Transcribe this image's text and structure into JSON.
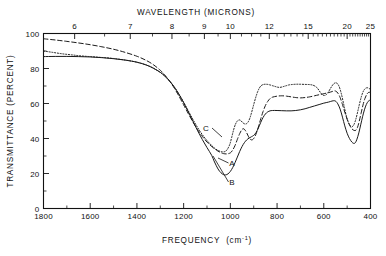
{
  "chart_data": {
    "type": "line",
    "title": "",
    "xlabel": "FREQUENCY (cm⁻¹)",
    "xlabel_main": "FREQUENCY",
    "xlabel_unit_open": "(cm",
    "xlabel_unit_sup": "-1",
    "xlabel_unit_close": ")",
    "ylabel": "TRANSMITTANCE (PERCENT)",
    "top_axis_label": "WAVELENGTH (MICRONS)",
    "xlim": [
      1800,
      400
    ],
    "ylim": [
      0,
      100
    ],
    "x_ticks": [
      1800,
      1600,
      1400,
      1200,
      1000,
      800,
      600,
      400
    ],
    "x_tick_labels": [
      "1800",
      "1600",
      "1400",
      "1200",
      "1000",
      "800",
      "600",
      "400"
    ],
    "y_ticks": [
      0,
      20,
      40,
      60,
      80,
      100
    ],
    "y_tick_labels": [
      "0",
      "20",
      "40",
      "60",
      "80",
      "100"
    ],
    "y_minor_ticks": [
      10,
      30,
      50,
      70,
      90
    ],
    "top_ticks_microns": [
      6,
      7,
      8,
      9,
      10,
      12,
      15,
      20,
      25
    ],
    "top_tick_labels": [
      "6",
      "7",
      "8",
      "9",
      "10",
      "12",
      "15",
      "20",
      "25"
    ],
    "top_minor_ticks_microns": [
      5.5,
      6.5,
      7.5,
      8.5,
      9.5,
      10.5,
      11,
      11.5,
      12.5,
      13,
      13.5,
      14,
      14.5,
      15.5,
      16,
      16.5,
      17,
      17.5,
      18,
      18.5,
      19,
      19.5,
      20.5,
      21,
      21.5,
      22,
      22.5,
      23,
      23.5,
      24,
      24.5
    ],
    "grid": false,
    "legend_position": "inline-annotations",
    "series": [
      {
        "name": "A",
        "label": "A",
        "style": "dashed",
        "color": "#1a1a1a",
        "points": [
          [
            1800,
            97.0
          ],
          [
            1750,
            96.3
          ],
          [
            1700,
            95.5
          ],
          [
            1650,
            94.6
          ],
          [
            1600,
            93.6
          ],
          [
            1550,
            92.4
          ],
          [
            1500,
            91.0
          ],
          [
            1450,
            89.2
          ],
          [
            1400,
            87.0
          ],
          [
            1360,
            84.6
          ],
          [
            1330,
            82.2
          ],
          [
            1300,
            79.0
          ],
          [
            1280,
            76.2
          ],
          [
            1260,
            72.8
          ],
          [
            1240,
            68.8
          ],
          [
            1220,
            64.2
          ],
          [
            1200,
            59.2
          ],
          [
            1180,
            54.2
          ],
          [
            1160,
            49.4
          ],
          [
            1140,
            45.0
          ],
          [
            1120,
            41.2
          ],
          [
            1100,
            38.0
          ],
          [
            1080,
            35.4
          ],
          [
            1060,
            33.4
          ],
          [
            1045,
            32.2
          ],
          [
            1030,
            31.4
          ],
          [
            1015,
            31.2
          ],
          [
            1000,
            31.8
          ],
          [
            990,
            33.4
          ],
          [
            980,
            36.0
          ],
          [
            970,
            39.5
          ],
          [
            960,
            42.8
          ],
          [
            952,
            44.8
          ],
          [
            945,
            45.6
          ],
          [
            938,
            45.0
          ],
          [
            930,
            43.2
          ],
          [
            922,
            41.0
          ],
          [
            915,
            39.6
          ],
          [
            908,
            39.2
          ],
          [
            900,
            40.0
          ],
          [
            890,
            42.6
          ],
          [
            880,
            46.6
          ],
          [
            870,
            51.2
          ],
          [
            860,
            55.4
          ],
          [
            850,
            58.8
          ],
          [
            840,
            61.2
          ],
          [
            830,
            62.8
          ],
          [
            820,
            63.6
          ],
          [
            800,
            64.2
          ],
          [
            780,
            64.4
          ],
          [
            760,
            64.2
          ],
          [
            740,
            63.8
          ],
          [
            720,
            63.4
          ],
          [
            700,
            63.2
          ],
          [
            680,
            63.4
          ],
          [
            660,
            63.8
          ],
          [
            640,
            64.4
          ],
          [
            620,
            65.0
          ],
          [
            600,
            65.6
          ],
          [
            580,
            66.2
          ],
          [
            565,
            66.8
          ],
          [
            555,
            67.2
          ],
          [
            548,
            67.0
          ],
          [
            540,
            66.0
          ],
          [
            530,
            63.4
          ],
          [
            520,
            59.4
          ],
          [
            510,
            55.0
          ],
          [
            500,
            51.0
          ],
          [
            490,
            47.8
          ],
          [
            480,
            45.6
          ],
          [
            470,
            44.6
          ],
          [
            462,
            44.8
          ],
          [
            455,
            46.6
          ],
          [
            448,
            50.0
          ],
          [
            440,
            54.6
          ],
          [
            432,
            59.2
          ],
          [
            424,
            62.8
          ],
          [
            416,
            65.2
          ],
          [
            410,
            66.2
          ],
          [
            404,
            66.4
          ],
          [
            400,
            66.2
          ]
        ]
      },
      {
        "name": "B",
        "label": "B",
        "style": "solid",
        "color": "#1a1a1a",
        "points": [
          [
            1800,
            86.8
          ],
          [
            1750,
            86.9
          ],
          [
            1700,
            86.9
          ],
          [
            1650,
            86.8
          ],
          [
            1600,
            86.6
          ],
          [
            1550,
            86.2
          ],
          [
            1500,
            85.6
          ],
          [
            1450,
            84.8
          ],
          [
            1400,
            83.6
          ],
          [
            1360,
            82.0
          ],
          [
            1330,
            80.2
          ],
          [
            1300,
            77.8
          ],
          [
            1280,
            75.6
          ],
          [
            1260,
            72.8
          ],
          [
            1240,
            69.4
          ],
          [
            1220,
            65.2
          ],
          [
            1200,
            60.4
          ],
          [
            1180,
            55.2
          ],
          [
            1160,
            49.8
          ],
          [
            1140,
            44.4
          ],
          [
            1120,
            39.4
          ],
          [
            1100,
            34.8
          ],
          [
            1080,
            30.4
          ],
          [
            1070,
            27.2
          ],
          [
            1060,
            24.4
          ],
          [
            1050,
            22.0
          ],
          [
            1040,
            20.4
          ],
          [
            1030,
            19.4
          ],
          [
            1020,
            19.2
          ],
          [
            1010,
            19.8
          ],
          [
            1000,
            21.2
          ],
          [
            990,
            23.4
          ],
          [
            980,
            26.2
          ],
          [
            970,
            29.4
          ],
          [
            960,
            32.6
          ],
          [
            950,
            35.4
          ],
          [
            940,
            37.6
          ],
          [
            930,
            39.2
          ],
          [
            920,
            40.2
          ],
          [
            910,
            41.0
          ],
          [
            900,
            41.8
          ],
          [
            890,
            43.4
          ],
          [
            880,
            46.0
          ],
          [
            870,
            49.2
          ],
          [
            860,
            52.0
          ],
          [
            850,
            54.0
          ],
          [
            840,
            55.2
          ],
          [
            830,
            55.8
          ],
          [
            820,
            56.0
          ],
          [
            800,
            56.0
          ],
          [
            780,
            55.9
          ],
          [
            760,
            55.8
          ],
          [
            740,
            55.8
          ],
          [
            720,
            56.0
          ],
          [
            700,
            56.4
          ],
          [
            680,
            57.0
          ],
          [
            660,
            57.8
          ],
          [
            640,
            58.6
          ],
          [
            620,
            59.4
          ],
          [
            600,
            60.2
          ],
          [
            580,
            60.8
          ],
          [
            565,
            61.4
          ],
          [
            555,
            61.6
          ],
          [
            548,
            61.2
          ],
          [
            540,
            59.8
          ],
          [
            530,
            56.8
          ],
          [
            520,
            52.2
          ],
          [
            510,
            47.2
          ],
          [
            500,
            43.0
          ],
          [
            490,
            40.0
          ],
          [
            480,
            38.0
          ],
          [
            472,
            37.2
          ],
          [
            465,
            37.6
          ],
          [
            458,
            39.6
          ],
          [
            450,
            43.2
          ],
          [
            442,
            47.8
          ],
          [
            434,
            52.4
          ],
          [
            426,
            56.4
          ],
          [
            418,
            59.4
          ],
          [
            410,
            61.2
          ],
          [
            404,
            61.8
          ],
          [
            400,
            61.6
          ]
        ]
      },
      {
        "name": "C",
        "label": "C",
        "style": "dotted",
        "color": "#1a1a1a",
        "points": [
          [
            1800,
            90.0
          ],
          [
            1760,
            89.2
          ],
          [
            1720,
            88.4
          ],
          [
            1680,
            87.8
          ],
          [
            1640,
            87.2
          ],
          [
            1600,
            86.8
          ],
          [
            1560,
            86.4
          ],
          [
            1520,
            86.0
          ],
          [
            1480,
            85.4
          ],
          [
            1440,
            84.6
          ],
          [
            1400,
            83.6
          ],
          [
            1360,
            82.0
          ],
          [
            1330,
            80.2
          ],
          [
            1300,
            77.8
          ],
          [
            1280,
            75.6
          ],
          [
            1260,
            72.8
          ],
          [
            1240,
            69.4
          ],
          [
            1220,
            65.4
          ],
          [
            1200,
            60.8
          ],
          [
            1180,
            55.8
          ],
          [
            1160,
            50.8
          ],
          [
            1140,
            46.2
          ],
          [
            1120,
            42.2
          ],
          [
            1100,
            38.8
          ],
          [
            1080,
            36.0
          ],
          [
            1065,
            34.2
          ],
          [
            1050,
            33.0
          ],
          [
            1035,
            32.4
          ],
          [
            1022,
            32.6
          ],
          [
            1012,
            34.0
          ],
          [
            1002,
            36.8
          ],
          [
            994,
            40.8
          ],
          [
            986,
            45.0
          ],
          [
            978,
            48.2
          ],
          [
            970,
            50.0
          ],
          [
            962,
            50.6
          ],
          [
            955,
            50.2
          ],
          [
            948,
            49.2
          ],
          [
            940,
            48.4
          ],
          [
            932,
            48.4
          ],
          [
            924,
            49.4
          ],
          [
            916,
            51.8
          ],
          [
            908,
            55.4
          ],
          [
            900,
            59.4
          ],
          [
            892,
            63.2
          ],
          [
            884,
            66.4
          ],
          [
            876,
            68.8
          ],
          [
            868,
            70.2
          ],
          [
            860,
            70.8
          ],
          [
            850,
            71.0
          ],
          [
            840,
            70.9
          ],
          [
            830,
            70.6
          ],
          [
            820,
            70.2
          ],
          [
            810,
            69.8
          ],
          [
            800,
            69.4
          ],
          [
            790,
            69.2
          ],
          [
            780,
            69.4
          ],
          [
            770,
            69.8
          ],
          [
            760,
            70.2
          ],
          [
            750,
            70.6
          ],
          [
            740,
            70.8
          ],
          [
            720,
            71.0
          ],
          [
            700,
            71.0
          ],
          [
            680,
            70.9
          ],
          [
            660,
            70.8
          ],
          [
            645,
            70.4
          ],
          [
            632,
            69.4
          ],
          [
            622,
            67.8
          ],
          [
            614,
            66.2
          ],
          [
            606,
            65.0
          ],
          [
            598,
            64.6
          ],
          [
            590,
            65.0
          ],
          [
            582,
            66.2
          ],
          [
            574,
            68.0
          ],
          [
            566,
            69.8
          ],
          [
            558,
            71.2
          ],
          [
            550,
            71.8
          ],
          [
            542,
            71.4
          ],
          [
            534,
            69.6
          ],
          [
            526,
            66.2
          ],
          [
            518,
            61.6
          ],
          [
            510,
            56.6
          ],
          [
            502,
            52.2
          ],
          [
            494,
            49.0
          ],
          [
            486,
            47.2
          ],
          [
            478,
            46.8
          ],
          [
            470,
            48.2
          ],
          [
            462,
            51.4
          ],
          [
            454,
            55.8
          ],
          [
            446,
            60.4
          ],
          [
            438,
            64.4
          ],
          [
            430,
            67.2
          ],
          [
            422,
            68.6
          ],
          [
            414,
            69.0
          ],
          [
            406,
            68.6
          ],
          [
            400,
            68.0
          ]
        ]
      }
    ],
    "annotations": [
      {
        "text": "A",
        "series": "A",
        "x_data": 930,
        "y_data": 33.0
      },
      {
        "text": "B",
        "series": "B",
        "x_data": 925,
        "y_data": 22.0
      },
      {
        "text": "C",
        "series": "C",
        "x_data": 1055,
        "y_data": 49.0
      }
    ]
  }
}
